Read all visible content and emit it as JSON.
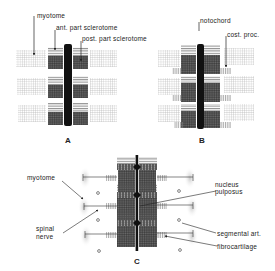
{
  "figure": {
    "panels": [
      {
        "id": "A",
        "label": "A",
        "annotations": {
          "myotome": "myotome",
          "ant_sclerotome": "ant. part sclerotome",
          "post_sclerotome": "post. part sclerotome"
        }
      },
      {
        "id": "B",
        "label": "B",
        "annotations": {
          "notochord": "notochord",
          "cost_proc": "cost. proc."
        }
      },
      {
        "id": "C",
        "label": "C",
        "annotations": {
          "myotome": "myotome",
          "spinal_nerve_1": "spinal",
          "spinal_nerve_2": "nerve",
          "nucleus_1": "nucleus",
          "nucleus_2": "pulposus",
          "segmental_art": "segmental art.",
          "fibrocartilage": "fibrocartilage"
        }
      }
    ],
    "colors": {
      "ink": "#111111",
      "hatch_light": "#9a9a9a",
      "hatch_dense": "#3a3a3a",
      "background": "#ffffff"
    }
  }
}
